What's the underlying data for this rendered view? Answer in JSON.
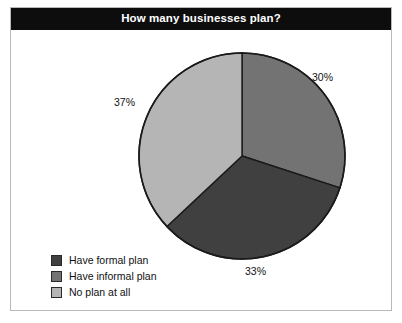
{
  "chart_data": {
    "type": "pie",
    "title": "How many businesses plan?",
    "xlabel": "",
    "ylabel": "",
    "categories": [
      "Have formal plan",
      "Have informal plan",
      "No plan at all"
    ],
    "values": [
      33,
      30,
      37
    ],
    "value_labels": [
      "33%",
      "30%",
      "37%"
    ],
    "colors": [
      "#404040",
      "#737373",
      "#b5b5b5"
    ],
    "slice_order_clockwise_from_top": [
      "Have informal plan",
      "Have formal plan",
      "No plan at all"
    ],
    "legend_position": "bottom-left",
    "grid": false,
    "outline_color": "#1a1a1a",
    "background": "#ffffff"
  },
  "frame": {
    "title_bar_color": "#0d0d0d",
    "title_text_color": "#ffffff",
    "border_color": "#b9b9b9"
  },
  "pie_geometry": {
    "center_x": 231,
    "center_y": 148,
    "radius": 103
  },
  "slices": [
    {
      "name": "Have informal plan",
      "percent_label": "30%",
      "color": "#737373",
      "path": "M 231 45 A 103 103 0 0 1 328 182 L 231 148 Z"
    },
    {
      "name": "Have formal plan",
      "percent_label": "33%",
      "color": "#404040",
      "path": "M 328 182 A 103 103 0 0 1 145 182 L 231 148 Z"
    },
    {
      "name": "No plan at all",
      "percent_label": "37%",
      "color": "#b5b5b5",
      "path": "M 145 182 A 103 103 0 0 1 231 45 L 231 148 Z"
    }
  ],
  "legend": {
    "items": [
      {
        "label": "Have formal plan",
        "color": "#404040"
      },
      {
        "label": "Have informal plan",
        "color": "#737373"
      },
      {
        "label": "No plan at all",
        "color": "#b5b5b5"
      }
    ]
  }
}
